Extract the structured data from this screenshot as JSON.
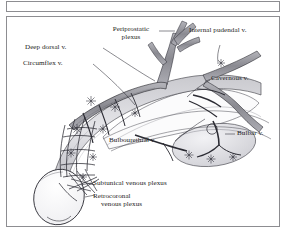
{
  "figure": {
    "type": "anatomical-illustration",
    "style": "black-and-white line engraving with stipple shading",
    "background_color": "#ffffff",
    "ink_color": "#1d1d22",
    "frame_color": "#8d8d91",
    "vessel_fill": "#9a9aa0",
    "tissue_fill": "#d8d8dc"
  },
  "labels": [
    {
      "id": "periprostatic-plexus",
      "line1": "Periprostatic",
      "line2": "plexus",
      "text": "Periprostatic plexus"
    },
    {
      "id": "internal-pudendal-v",
      "line1": "Internal pudendal v.",
      "line2": "",
      "text": "Internal pudendal v."
    },
    {
      "id": "deep-dorsal-v",
      "line1": "Deep dorsal v.",
      "line2": "",
      "text": "Deep dorsal v."
    },
    {
      "id": "circumflex-v",
      "line1": "Circumflex v.",
      "line2": "",
      "text": "Circumflex v."
    },
    {
      "id": "cavernous-v",
      "line1": "Cavernous v.",
      "line2": "",
      "text": "Cavernous v."
    },
    {
      "id": "bulbourethral-v",
      "line1": "Bulbourethral v.",
      "line2": "",
      "text": "Bulbourethral v."
    },
    {
      "id": "bulbar-v",
      "line1": "Bulbar v.",
      "line2": "",
      "text": "Bulbar v."
    },
    {
      "id": "subtunical-venous-plexus",
      "line1": "Subtunical venous plexus",
      "line2": "",
      "text": "Subtunical venous plexus"
    },
    {
      "id": "retrocoronal-venous-plexus",
      "line1": "Retrocoronal",
      "line2": "venous plexus",
      "text": "Retrocoronal venous plexus"
    }
  ],
  "label_text": {
    "periprostatic_l1": "Periprostatic",
    "periprostatic_l2": "plexus",
    "internal_pudendal": "Internal pudendal v.",
    "deep_dorsal": "Deep dorsal v.",
    "circumflex": "Circumflex v.",
    "cavernous": "Cavernous v.",
    "bulbourethral": "Bulbourethral v.",
    "bulbar": "Bulbar v.",
    "subtunical": "Subtunical venous plexus",
    "retrocoronal_l1": "Retrocoronal",
    "retrocoronal_l2": "venous plexus"
  }
}
